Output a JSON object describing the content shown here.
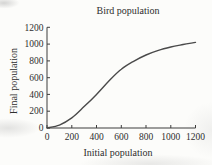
{
  "chart_data": {
    "type": "line",
    "title": "Bird population",
    "xlabel": "Initial population",
    "ylabel": "Final population",
    "x": [
      0,
      100,
      200,
      300,
      400,
      500,
      600,
      700,
      800,
      900,
      1000,
      1100,
      1200
    ],
    "y": [
      0,
      35,
      120,
      255,
      400,
      560,
      700,
      795,
      870,
      925,
      965,
      995,
      1020
    ],
    "xlim": [
      0,
      1200
    ],
    "ylim": [
      0,
      1200
    ],
    "x_ticks": [
      0,
      200,
      400,
      600,
      800,
      1000,
      1200
    ],
    "y_ticks": [
      0,
      200,
      400,
      600,
      800,
      1000,
      1200
    ],
    "grid": false,
    "legend": "none",
    "curve_color": "#4a4a4a",
    "axis_color": "#3c3c3c",
    "text_color": "#2e2e2e",
    "background_color": "#fcfcfa"
  }
}
